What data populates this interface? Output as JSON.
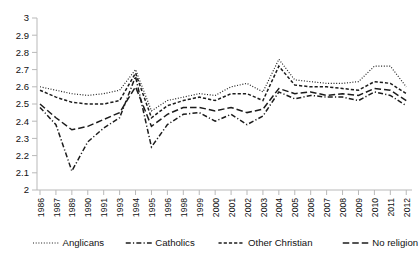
{
  "chart_data": {
    "type": "line",
    "title": "",
    "subtitle": "",
    "xlabel": "",
    "ylabel": "",
    "ylim": [
      2,
      3
    ],
    "ytick_labels": [
      "2",
      "2.1",
      "2.2",
      "2.3",
      "2.4",
      "2.5",
      "2.6",
      "2.7",
      "2.8",
      "2.9",
      "3"
    ],
    "ytick_values": [
      2,
      2.1,
      2.2,
      2.3,
      2.4,
      2.5,
      2.6,
      2.7,
      2.8,
      2.9,
      3
    ],
    "grid": false,
    "legend_position": "bottom",
    "categories": [
      "1986",
      "1987",
      "1989",
      "1990",
      "1991",
      "1993",
      "1994",
      "1995",
      "1996",
      "1998",
      "1999",
      "2000",
      "2001",
      "2002",
      "2003",
      "2004",
      "2005",
      "2006",
      "2007",
      "2008",
      "2009",
      "2010",
      "2011",
      "2012"
    ],
    "series": [
      {
        "name": "Anglicans",
        "dash": "dotted",
        "values": [
          2.6,
          2.58,
          2.56,
          2.55,
          2.56,
          2.58,
          2.7,
          2.46,
          2.52,
          2.54,
          2.56,
          2.55,
          2.6,
          2.62,
          2.57,
          2.76,
          2.64,
          2.63,
          2.62,
          2.62,
          2.63,
          2.72,
          2.72,
          2.6
        ]
      },
      {
        "name": "Catholics",
        "dash": "dash-dot",
        "values": [
          2.48,
          2.38,
          2.11,
          2.28,
          2.36,
          2.42,
          2.66,
          2.25,
          2.38,
          2.44,
          2.45,
          2.4,
          2.44,
          2.38,
          2.43,
          2.57,
          2.53,
          2.55,
          2.54,
          2.54,
          2.52,
          2.57,
          2.55,
          2.49
        ]
      },
      {
        "name": "Other Christian",
        "dash": "dashed-short",
        "values": [
          2.58,
          2.54,
          2.51,
          2.5,
          2.5,
          2.52,
          2.68,
          2.42,
          2.49,
          2.52,
          2.54,
          2.52,
          2.56,
          2.56,
          2.52,
          2.72,
          2.61,
          2.6,
          2.6,
          2.59,
          2.58,
          2.63,
          2.62,
          2.56
        ]
      },
      {
        "name": "No religion",
        "dash": "dashed-long",
        "values": [
          2.5,
          2.42,
          2.35,
          2.37,
          2.41,
          2.45,
          2.6,
          2.37,
          2.44,
          2.48,
          2.48,
          2.46,
          2.48,
          2.45,
          2.47,
          2.59,
          2.56,
          2.57,
          2.55,
          2.56,
          2.55,
          2.59,
          2.58,
          2.52
        ]
      }
    ]
  },
  "legend": {
    "items": [
      {
        "label": "Anglicans"
      },
      {
        "label": "Catholics"
      },
      {
        "label": "Other Christian"
      },
      {
        "label": "No religion"
      }
    ]
  },
  "colors": {
    "line": "#1c1c1c",
    "axis": "#b9b9b9",
    "text": "#111111",
    "background": "#ffffff"
  }
}
